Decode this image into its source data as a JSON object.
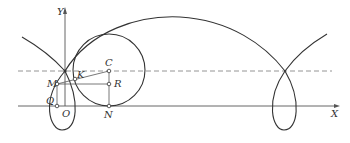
{
  "figure": {
    "type": "trochoid-with-rolling-circle",
    "axes": {
      "x_label": "X",
      "y_label": "Y"
    },
    "points": {
      "C": "C",
      "K": "K",
      "M": "M",
      "R": "R",
      "Q": "Q",
      "O": "O",
      "N": "N"
    },
    "colors": {
      "stroke": "#333333",
      "dashed": "#888888",
      "axis": "#555555"
    }
  }
}
